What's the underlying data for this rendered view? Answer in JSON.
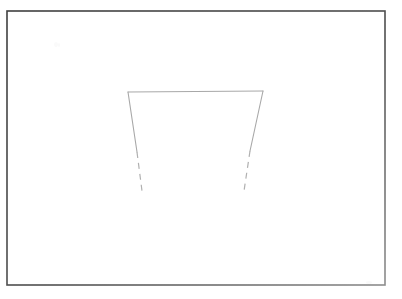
{
  "page": {
    "title": "Scanned Geometric Figure",
    "background_color": "#ffffff",
    "width": 402,
    "height": 299
  },
  "frame": {
    "name": "page-border",
    "description": "Thin dark rectangular border enclosing the drawing area",
    "color": "#4a4a4a",
    "stroke_width": 1.6,
    "x": 7,
    "y": 11,
    "width": 378,
    "height": 274,
    "fill": "none"
  },
  "figure": {
    "name": "trapezoid-outline",
    "description": "Open trapezoid: solid top edge with two slanted legs that fade from solid into dashed lines near the bottom",
    "stroke_color": "#a8a8a8",
    "stroke_width": 1.1,
    "dash_color": "#b0b0b0",
    "dash_pattern": "6 5",
    "vertices": {
      "top_left": {
        "x": 128,
        "y": 92
      },
      "top_right": {
        "x": 263,
        "y": 91
      },
      "left_solid_end": {
        "x": 137,
        "y": 152
      },
      "right_solid_end": {
        "x": 250,
        "y": 151
      },
      "left_dash_end": {
        "x": 142,
        "y": 191
      },
      "right_dash_end": {
        "x": 244,
        "y": 191
      }
    },
    "segments": [
      {
        "name": "top-edge",
        "style": "solid",
        "from": "top_left",
        "to": "top_right"
      },
      {
        "name": "left-leg-solid",
        "style": "solid",
        "from": "top_left",
        "to": "left_solid_end"
      },
      {
        "name": "left-leg-dashed",
        "style": "dashed",
        "from": "left_solid_end",
        "to": "left_dash_end"
      },
      {
        "name": "right-leg-solid",
        "style": "solid",
        "from": "top_right",
        "to": "right_solid_end"
      },
      {
        "name": "right-leg-dashed",
        "style": "dashed",
        "from": "right_solid_end",
        "to": "right_dash_end"
      }
    ]
  },
  "artifacts": {
    "description": "Faint scanner specks on the white background",
    "color": "#fafafa"
  }
}
